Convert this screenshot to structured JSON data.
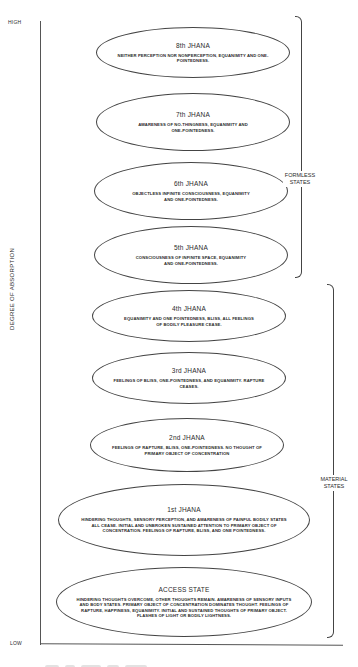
{
  "axis": {
    "high_label": "HIGH",
    "low_label": "LOW",
    "title": "DEGREE OF ABSORPTION"
  },
  "groups": {
    "formless": "FORMLESS\nSTATES",
    "formless_line1": "FORMLESS",
    "formless_line2": "STATES",
    "material_line1": "MATERIAL",
    "material_line2": "STATES"
  },
  "states": [
    {
      "title": "8th JHANA",
      "desc": "NEITHER PERCEPTION NOR NONPERCEPTION, EQUANIMITY AND ONE-POINTEDNESS."
    },
    {
      "title": "7th JHANA",
      "desc": "AWARENESS OF NO-THINGNESS, EQUANIMITY AND ONE-POINTEDNESS."
    },
    {
      "title": "6th JHANA",
      "desc": "OBJECTLESS INFINITE CONSCIOUSNESS, EQUANIMITY AND ONE-POINTEDNESS."
    },
    {
      "title": "5th JHANA",
      "desc": "CONSCIOUSNESS OF INFINITE SPACE, EQUANIMITY AND ONE-POINTEDNESS."
    },
    {
      "title": "4th JHANA",
      "desc": "EQUANIMITY AND ONE POINTEDNESS, BLISS, ALL FEELINGS OF BODILY PLEASURE CEASE."
    },
    {
      "title": "3rd JHANA",
      "desc": "FEELINGS OF BLISS, ONE-POINTEDNESS, AND EQUANIMITY. RAPTURE CEASES."
    },
    {
      "title": "2nd JHANA",
      "desc": "FEELINGS OF RAPTURE, BLISS, ONE-POINTEDNESS. NO THOUGHT OF PRIMARY OBJECT OF CONCENTRATION"
    },
    {
      "title": "1st JHANA",
      "desc": "HINDERING THOUGHTS, SENSORY PERCEPTION, AND AWARENESS OF PAINFUL BODILY STATES ALL CEASE. INITIAL AND UNBROKEN SUSTAINED ATTENTION TO PRIMARY OBJECT OF CONCENTRATION. FEELINGS OF RAPTURE, BLISS, AND ONE POINTEDNESS."
    },
    {
      "title": "ACCESS STATE",
      "desc": "HINDERING THOUGHTS OVERCOME, OTHER THOUGHTS REMAIN. AWARENESS OF SENSORY INPUTS AND BODY STATES. PRIMARY OBJECT OF CONCENTRATION DOMINATES THOUGHT. FEELINGS OF RAPTURE, HAPPINESS, EQUANIMITY. INITIAL AND SUSTAINED THOUGHTS OF PRIMARY OBJECT. FLASHES OF LIGHT OR BODILY LIGHTNESS."
    }
  ]
}
